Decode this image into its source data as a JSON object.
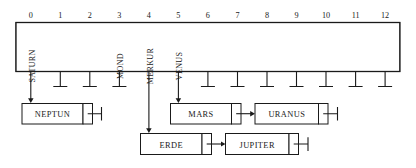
{
  "diagram": {
    "type": "hash-table-separate-chaining",
    "colors": {
      "ink": "#1a1a1a",
      "paper": "#ffffff"
    },
    "table": {
      "slot_count": 13,
      "index_labels": [
        "0",
        "1",
        "2",
        "3",
        "4",
        "5",
        "6",
        "7",
        "8",
        "9",
        "10",
        "11",
        "12"
      ],
      "slots": [
        {
          "index": "0",
          "key": "SATURN",
          "occupied": true,
          "link": "chain"
        },
        {
          "index": "1",
          "key": "",
          "occupied": false,
          "link": "null"
        },
        {
          "index": "2",
          "key": "",
          "occupied": false,
          "link": "null"
        },
        {
          "index": "3",
          "key": "MOND",
          "occupied": true,
          "link": "null"
        },
        {
          "index": "4",
          "key": "MERKUR",
          "occupied": true,
          "link": "chain"
        },
        {
          "index": "5",
          "key": "VENUS",
          "occupied": true,
          "link": "chain"
        },
        {
          "index": "6",
          "key": "",
          "occupied": false,
          "link": "null"
        },
        {
          "index": "7",
          "key": "",
          "occupied": false,
          "link": "null"
        },
        {
          "index": "8",
          "key": "",
          "occupied": false,
          "link": "null"
        },
        {
          "index": "9",
          "key": "",
          "occupied": false,
          "link": "null"
        },
        {
          "index": "10",
          "key": "",
          "occupied": false,
          "link": "null"
        },
        {
          "index": "11",
          "key": "",
          "occupied": false,
          "link": "null"
        },
        {
          "index": "12",
          "key": "",
          "occupied": false,
          "link": "null"
        }
      ]
    },
    "chains": [
      {
        "from_slot": "0",
        "nodes": [
          {
            "label": "NEPTUN",
            "next": "null"
          }
        ]
      },
      {
        "from_slot": "5",
        "nodes": [
          {
            "label": "MARS",
            "next": "URANUS"
          },
          {
            "label": "URANUS",
            "next": "null"
          }
        ]
      },
      {
        "from_slot": "4",
        "nodes": [
          {
            "label": "ERDE",
            "next": "JUPITER"
          },
          {
            "label": "JUPITER",
            "next": "null"
          }
        ]
      }
    ],
    "node_labels": {
      "neptun": "NEPTUN",
      "mars": "MARS",
      "uranus": "URANUS",
      "erde": "ERDE",
      "jupiter": "JUPITER"
    },
    "slot_keys": {
      "s0": "SATURN",
      "s3": "MOND",
      "s4": "MERKUR",
      "s5": "VENUS"
    }
  }
}
